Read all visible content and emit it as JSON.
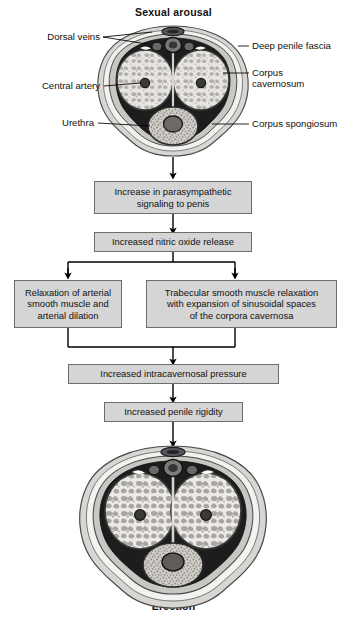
{
  "figure": {
    "top_title": "Sexual arousal",
    "bottom_title": "Erection"
  },
  "anatomy_labels": {
    "left": [
      {
        "name": "dorsal-veins",
        "text": "Dorsal veins"
      },
      {
        "name": "central-artery",
        "text": "Central artery"
      },
      {
        "name": "urethra",
        "text": "Urethra"
      }
    ],
    "right": [
      {
        "name": "deep-penile-fascia",
        "text": "Deep penile fascia"
      },
      {
        "name": "corpus-cavernosum-line1",
        "text": "Corpus"
      },
      {
        "name": "corpus-cavernosum-line2",
        "text": "cavernosum"
      },
      {
        "name": "corpus-spongiosum",
        "text": "Corpus spongiosum"
      }
    ]
  },
  "flowchart": {
    "steps": [
      {
        "id": "parasympathetic",
        "line1": "Increase in parasympathetic",
        "line2": "signaling to penis"
      },
      {
        "id": "nitric-oxide",
        "line1": "Increased nitric oxide release"
      },
      {
        "id": "arterial-relaxation",
        "line1": "Relaxation of arterial",
        "line2": "smooth muscle and",
        "line3": "arterial dilation"
      },
      {
        "id": "trabecular-relaxation",
        "line1": "Trabecular smooth muscle relaxation",
        "line2": "with expansion of sinusoidal spaces",
        "line3": "of the corpora cavernosa"
      },
      {
        "id": "intracavernosal-pressure",
        "line1": "Increased intracavernosal pressure"
      },
      {
        "id": "penile-rigidity",
        "line1": "Increased penile rigidity"
      }
    ]
  },
  "colors": {
    "box_fill": "#d5d5d5",
    "box_border": "#6d6d6d",
    "connector": "#000000",
    "tissue_light": "#e8e6e2",
    "tissue_mid": "#b9b6b1",
    "tissue_dark": "#2b2b2b",
    "fascia": "#c9c7c3",
    "background": "#ffffff"
  }
}
